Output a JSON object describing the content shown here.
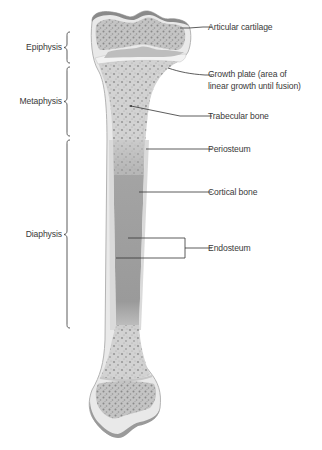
{
  "diagram": {
    "regions": [
      {
        "id": "epiphysis",
        "label": "Epiphysis"
      },
      {
        "id": "metaphysis",
        "label": "Metaphysis"
      },
      {
        "id": "diaphysis",
        "label": "Diaphysis"
      }
    ],
    "structures": [
      {
        "id": "articular-cartilage",
        "label": "Articular cartilage"
      },
      {
        "id": "growth-plate",
        "label_line1": "Growth plate (area of",
        "label_line2": "linear growth until fusion)"
      },
      {
        "id": "trabecular-bone",
        "label": "Trabecular bone"
      },
      {
        "id": "periosteum",
        "label": "Periosteum"
      },
      {
        "id": "cortical-bone",
        "label": "Cortical bone"
      },
      {
        "id": "endosteum",
        "label": "Endosteum"
      }
    ],
    "colors": {
      "cartilage": "#8a8a8a",
      "bone_outer": "#e6e6e6",
      "cortical": "#d4d4d4",
      "trabecular": "#c2c2c2",
      "marrow_cavity": "#9a9a9a",
      "leader_line": "#333333",
      "text": "#3a3a3a"
    }
  }
}
